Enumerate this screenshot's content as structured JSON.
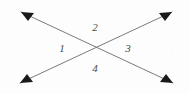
{
  "figure": {
    "canvas": {
      "width": 189,
      "height": 94
    },
    "background_color": "#fdfdfd",
    "stroke_color": "#7a7a7a",
    "arrowhead_color": "#1a1a1a",
    "label_color": "#4a4a4a",
    "stroke_width": 1,
    "intersection": {
      "x": 96,
      "y": 48
    },
    "lines": [
      {
        "name": "line-nw-se",
        "from": {
          "x": 21,
          "y": 12
        },
        "to": {
          "x": 173,
          "y": 83
        },
        "arrow_start": true,
        "arrow_end": true
      },
      {
        "name": "line-sw-ne",
        "from": {
          "x": 20,
          "y": 83
        },
        "to": {
          "x": 172,
          "y": 12
        },
        "arrow_start": true,
        "arrow_end": true
      }
    ],
    "arrowheads": [
      {
        "name": "arrowhead-top-left",
        "x": 21,
        "y": 12,
        "angle_deg": 205
      },
      {
        "name": "arrowhead-top-right",
        "x": 172,
        "y": 12,
        "angle_deg": 335
      },
      {
        "name": "arrowhead-bottom-left",
        "x": 20,
        "y": 83,
        "angle_deg": 155
      },
      {
        "name": "arrowhead-bottom-right",
        "x": 173,
        "y": 83,
        "angle_deg": 25
      }
    ],
    "angle_labels": [
      {
        "name": "angle-label-1",
        "text": "1",
        "x": 62,
        "y": 48,
        "position": "left"
      },
      {
        "name": "angle-label-2",
        "text": "2",
        "x": 95,
        "y": 27,
        "position": "top"
      },
      {
        "name": "angle-label-3",
        "text": "3",
        "x": 128,
        "y": 48,
        "position": "right"
      },
      {
        "name": "angle-label-4",
        "text": "4",
        "x": 95,
        "y": 68,
        "position": "bottom"
      }
    ]
  }
}
